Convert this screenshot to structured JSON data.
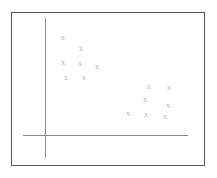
{
  "figure": {
    "title": "",
    "background_color": "#ffffff",
    "border_color": "#595959",
    "axis_color": "#8a8a8a",
    "marker_color": "#b9b9b9",
    "marker_glyph": "x"
  },
  "axes": {
    "y_axis_label": "",
    "x_axis_label": "",
    "y_axis": {
      "x": 45,
      "top": 18,
      "bottom": 157
    },
    "x_axis": {
      "y": 135,
      "left": 23,
      "right": 188
    },
    "tick_labels_x": [],
    "tick_labels_y": [],
    "grid": false
  },
  "chart_data": {
    "type": "scatter",
    "title": "",
    "xlabel": "",
    "ylabel": "",
    "xlim": [
      0,
      100
    ],
    "ylim": [
      0,
      100
    ],
    "grid": false,
    "legend": null,
    "marker": "x",
    "series": [
      {
        "name": "cluster-upper-left",
        "marker": "x",
        "color": "#b9b9b9",
        "points": [
          {
            "x": 13,
            "y": 84,
            "px": 63,
            "py": 37
          },
          {
            "x": 25,
            "y": 75,
            "px": 81,
            "py": 48
          },
          {
            "x": 13,
            "y": 63,
            "px": 63,
            "py": 62
          },
          {
            "x": 25,
            "y": 63,
            "px": 80,
            "py": 63
          },
          {
            "x": 37,
            "y": 58,
            "px": 97,
            "py": 66
          },
          {
            "x": 15,
            "y": 50,
            "px": 66,
            "py": 77
          },
          {
            "x": 28,
            "y": 50,
            "px": 84,
            "py": 77
          }
        ]
      },
      {
        "name": "cluster-lower-right",
        "marker": "x",
        "color": "#b9b9b9",
        "points": [
          {
            "x": 73,
            "y": 42,
            "px": 149,
            "py": 86
          },
          {
            "x": 87,
            "y": 41,
            "px": 169,
            "py": 87
          },
          {
            "x": 70,
            "y": 31,
            "px": 145,
            "py": 99
          },
          {
            "x": 86,
            "y": 27,
            "px": 168,
            "py": 105
          },
          {
            "x": 58,
            "y": 21,
            "px": 128,
            "py": 113
          },
          {
            "x": 71,
            "y": 20,
            "px": 146,
            "py": 114
          },
          {
            "x": 84,
            "y": 19,
            "px": 165,
            "py": 116
          }
        ]
      }
    ],
    "total_points": 14
  }
}
